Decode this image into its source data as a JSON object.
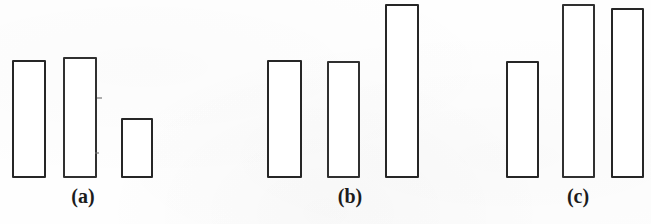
{
  "figure": {
    "background_color": "#fefefe",
    "line_color": "#262626",
    "fill_color": "#ffffff",
    "width": 651,
    "height": 224,
    "baseline_y": 178
  },
  "groups": [
    {
      "label": "(a)",
      "label_x": 83,
      "label_y": 186,
      "bars": [
        {
          "x": 12,
          "y": 60,
          "width": 34,
          "height": 118,
          "value": 118
        },
        {
          "x": 63,
          "y": 57,
          "width": 34,
          "height": 121,
          "value": 121
        },
        {
          "x": 121,
          "y": 118,
          "width": 32,
          "height": 60,
          "value": 60
        }
      ]
    },
    {
      "label": "(b)",
      "label_x": 350,
      "label_y": 186,
      "bars": [
        {
          "x": 267,
          "y": 60,
          "width": 35,
          "height": 118,
          "value": 118
        },
        {
          "x": 327,
          "y": 61,
          "width": 33,
          "height": 117,
          "value": 117
        },
        {
          "x": 385,
          "y": 4,
          "width": 34,
          "height": 174,
          "value": 174
        }
      ]
    },
    {
      "label": "(c)",
      "label_x": 578,
      "label_y": 186,
      "bars": [
        {
          "x": 506,
          "y": 61,
          "width": 33,
          "height": 117,
          "value": 117
        },
        {
          "x": 562,
          "y": 4,
          "width": 33,
          "height": 174,
          "value": 174
        },
        {
          "x": 611,
          "y": 8,
          "width": 33,
          "height": 170,
          "value": 170
        }
      ]
    }
  ],
  "chart_data": {
    "type": "bar",
    "title": "",
    "xlabel": "",
    "ylabel": "",
    "grid": false,
    "legend": "none",
    "ylim": [
      0,
      180
    ],
    "panels": [
      {
        "name": "(a)",
        "categories": [
          "1",
          "2",
          "3"
        ],
        "values": [
          118,
          121,
          60
        ]
      },
      {
        "name": "(b)",
        "categories": [
          "1",
          "2",
          "3"
        ],
        "values": [
          118,
          117,
          174
        ]
      },
      {
        "name": "(c)",
        "categories": [
          "1",
          "2",
          "3"
        ],
        "values": [
          117,
          174,
          170
        ]
      }
    ],
    "annotations": [
      "(a)",
      "(b)",
      "(c)"
    ]
  },
  "specks": [
    {
      "x": 97,
      "y": 97,
      "w": 5,
      "h": 2
    },
    {
      "x": 95,
      "y": 152,
      "w": 4,
      "h": 2
    }
  ]
}
